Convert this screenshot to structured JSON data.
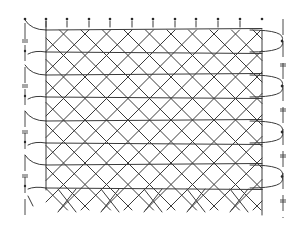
{
  "diagram": {
    "title": "",
    "type": "bobbin-lace-pricking",
    "colors": {
      "ink": "#3a3a3a",
      "background": "#ffffff"
    },
    "top_pins_x": [
      25,
      46,
      67,
      89,
      110,
      132,
      153,
      175,
      196,
      218,
      240,
      262
    ],
    "top_pin_y": 19,
    "rows_y": [
      30,
      52,
      75,
      97,
      121,
      143,
      165,
      188
    ],
    "left_column_x": 46,
    "right_column_x": 262,
    "left_edge_x": 25,
    "right_edge_x": 283,
    "bottom_cross_y": [
      195,
      212
    ]
  }
}
